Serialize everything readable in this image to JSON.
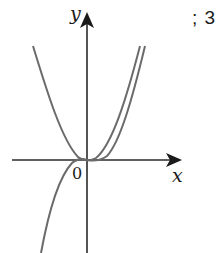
{
  "figure": {
    "problem_marker": "; 3",
    "labels": {
      "y_axis": "y",
      "x_axis": "x",
      "origin": "0"
    },
    "curves": [
      {
        "name": "parabola",
        "description": "U-shaped curve opening upward with vertex at origin"
      },
      {
        "name": "cubic",
        "description": "S-shaped curve through origin, rising from bottom-left to top-right"
      }
    ],
    "colors": {
      "curve": "#6b6b6b",
      "axis": "#2a2a2a",
      "text": "#1a1a1a"
    }
  }
}
